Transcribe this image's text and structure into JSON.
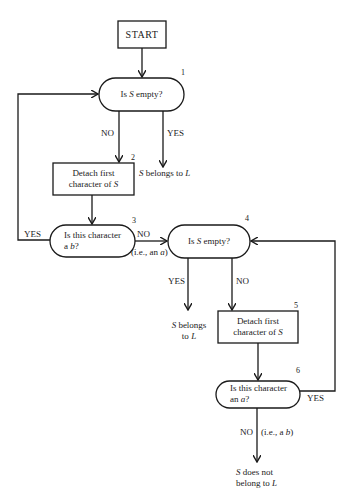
{
  "nodes": {
    "start": {
      "label": "START"
    },
    "n1": {
      "num": "1",
      "pre": "Is ",
      "var": "S",
      "post": " empty?"
    },
    "n2": {
      "num": "2",
      "line1": "Detach first",
      "line2_pre": "character of ",
      "line2_var": "S"
    },
    "n3": {
      "num": "3",
      "line1": "Is this character",
      "line2_pre": "a ",
      "line2_var": "b",
      "line2_post": "?"
    },
    "n4": {
      "num": "4",
      "pre": "Is ",
      "var": "S",
      "post": " empty?"
    },
    "n5": {
      "num": "5",
      "line1": "Detach first",
      "line2_pre": "character of ",
      "line2_var": "S"
    },
    "n6": {
      "num": "6",
      "line1": "Is this character",
      "line2_pre": "an ",
      "line2_var": "a",
      "line2_post": "?"
    }
  },
  "edges": {
    "n1_no": "NO",
    "n1_yes": "YES",
    "n3_yes": "YES",
    "n3_no": "NO",
    "n3_no_note_pre": "(i.e., an ",
    "n3_no_note_var": "a",
    "n3_no_note_post": ")",
    "n4_yes": "YES",
    "n4_no": "NO",
    "n6_yes": "YES",
    "n6_no": "NO",
    "n6_no_note_pre": "(i.e., a ",
    "n6_no_note_var": "b",
    "n6_no_note_post": ")"
  },
  "outcomes": {
    "o1": {
      "var": "S",
      "text": " belongs to ",
      "var2": "L"
    },
    "o4": {
      "var": "S",
      "line1": " belongs",
      "line2_pre": "to ",
      "var2": "L"
    },
    "o6": {
      "var": "S",
      "line1": " does not",
      "line2_pre": "belong to ",
      "var2": "L"
    }
  },
  "colors": {
    "stroke": "#1a1a1a",
    "background": "#ffffff"
  }
}
